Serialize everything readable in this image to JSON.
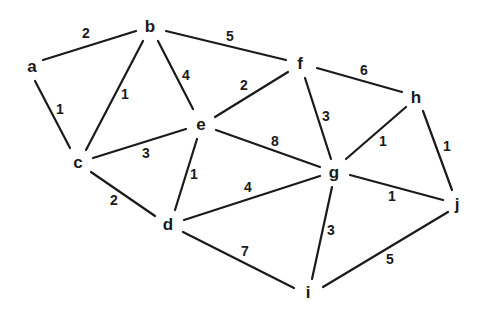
{
  "diagram": {
    "type": "weighted-undirected-graph",
    "nodes": [
      {
        "id": "a",
        "label": "a",
        "x": 32,
        "y": 66
      },
      {
        "id": "b",
        "label": "b",
        "x": 150,
        "y": 26
      },
      {
        "id": "c",
        "label": "c",
        "x": 78,
        "y": 162
      },
      {
        "id": "d",
        "label": "d",
        "x": 168,
        "y": 224
      },
      {
        "id": "e",
        "label": "e",
        "x": 201,
        "y": 124
      },
      {
        "id": "f",
        "label": "f",
        "x": 300,
        "y": 63
      },
      {
        "id": "g",
        "label": "g",
        "x": 334,
        "y": 172
      },
      {
        "id": "h",
        "label": "h",
        "x": 416,
        "y": 97
      },
      {
        "id": "i",
        "label": "i",
        "x": 308,
        "y": 292
      },
      {
        "id": "j",
        "label": "j",
        "x": 457,
        "y": 204
      }
    ],
    "edges": [
      {
        "from": "a",
        "to": "b",
        "weight": "2",
        "x1": 43,
        "y1": 60,
        "x2": 136,
        "y2": 31,
        "lx": 86,
        "ly": 33
      },
      {
        "from": "a",
        "to": "c",
        "weight": "1",
        "x1": 35,
        "y1": 81,
        "x2": 70,
        "y2": 148,
        "lx": 60,
        "ly": 109
      },
      {
        "from": "b",
        "to": "c",
        "weight": "1",
        "x1": 143,
        "y1": 41,
        "x2": 86,
        "y2": 150,
        "lx": 125,
        "ly": 94
      },
      {
        "from": "b",
        "to": "e",
        "weight": "4",
        "x1": 158,
        "y1": 41,
        "x2": 193,
        "y2": 109,
        "lx": 186,
        "ly": 75
      },
      {
        "from": "b",
        "to": "f",
        "weight": "5",
        "x1": 166,
        "y1": 31,
        "x2": 286,
        "y2": 60,
        "lx": 230,
        "ly": 36
      },
      {
        "from": "c",
        "to": "e",
        "weight": "3",
        "x1": 93,
        "y1": 158,
        "x2": 186,
        "y2": 129,
        "lx": 146,
        "ly": 153
      },
      {
        "from": "c",
        "to": "d",
        "weight": "2",
        "x1": 91,
        "y1": 172,
        "x2": 155,
        "y2": 216,
        "lx": 114,
        "ly": 200
      },
      {
        "from": "e",
        "to": "d",
        "weight": "1",
        "x1": 197,
        "y1": 139,
        "x2": 175,
        "y2": 210,
        "lx": 194,
        "ly": 174
      },
      {
        "from": "e",
        "to": "f",
        "weight": "2",
        "x1": 215,
        "y1": 117,
        "x2": 288,
        "y2": 72,
        "lx": 244,
        "ly": 85
      },
      {
        "from": "e",
        "to": "g",
        "weight": "8",
        "x1": 216,
        "y1": 130,
        "x2": 320,
        "y2": 167,
        "lx": 275,
        "ly": 141
      },
      {
        "from": "f",
        "to": "h",
        "weight": "6",
        "x1": 317,
        "y1": 68,
        "x2": 402,
        "y2": 92,
        "lx": 364,
        "ly": 70
      },
      {
        "from": "f",
        "to": "g",
        "weight": "3",
        "x1": 305,
        "y1": 78,
        "x2": 331,
        "y2": 159,
        "lx": 326,
        "ly": 116
      },
      {
        "from": "h",
        "to": "g",
        "weight": "1",
        "x1": 406,
        "y1": 107,
        "x2": 346,
        "y2": 159,
        "lx": 383,
        "ly": 141
      },
      {
        "from": "h",
        "to": "j",
        "weight": "1",
        "x1": 423,
        "y1": 111,
        "x2": 452,
        "y2": 190,
        "lx": 447,
        "ly": 146
      },
      {
        "from": "g",
        "to": "j",
        "weight": "1",
        "x1": 350,
        "y1": 175,
        "x2": 443,
        "y2": 200,
        "lx": 392,
        "ly": 196
      },
      {
        "from": "d",
        "to": "g",
        "weight": "4",
        "x1": 184,
        "y1": 220,
        "x2": 320,
        "y2": 176,
        "lx": 248,
        "ly": 187
      },
      {
        "from": "g",
        "to": "i",
        "weight": "3",
        "x1": 332,
        "y1": 187,
        "x2": 312,
        "y2": 279,
        "lx": 331,
        "ly": 230
      },
      {
        "from": "d",
        "to": "i",
        "weight": "7",
        "x1": 183,
        "y1": 232,
        "x2": 294,
        "y2": 288,
        "lx": 245,
        "ly": 251
      },
      {
        "from": "j",
        "to": "i",
        "weight": "5",
        "x1": 448,
        "y1": 212,
        "x2": 323,
        "y2": 287,
        "lx": 390,
        "ly": 259
      }
    ]
  }
}
